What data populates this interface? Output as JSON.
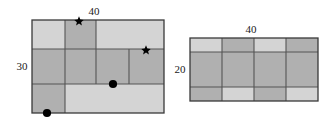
{
  "figure": {
    "title": "",
    "background_color": "#ffffff",
    "stroke_color": "#404040",
    "light_fill": "#d4d4d4",
    "dark_fill": "#b0b0b0",
    "marker_color": "#000000"
  },
  "labels": {
    "left_width": "40",
    "left_height": "30",
    "right_width": "40",
    "right_height": "20"
  },
  "left_rectangle": {
    "name": "left-rectangle",
    "width_label": "40",
    "height_label": "30",
    "cells": [
      {
        "id": "L-r1c1",
        "shade": "light"
      },
      {
        "id": "L-r1c2",
        "shade": "dark"
      },
      {
        "id": "L-r1c3",
        "shade": "light"
      },
      {
        "id": "L-r2c1",
        "shade": "dark"
      },
      {
        "id": "L-r2c2",
        "shade": "dark"
      },
      {
        "id": "L-r2c3",
        "shade": "dark"
      },
      {
        "id": "L-r2c4",
        "shade": "dark"
      },
      {
        "id": "L-r3c1",
        "shade": "dark"
      },
      {
        "id": "L-r3c2",
        "shade": "light"
      }
    ],
    "markers": [
      {
        "id": "L-star-top",
        "type": "star",
        "edge": "top"
      },
      {
        "id": "L-star-right",
        "type": "star",
        "edge": "right"
      },
      {
        "id": "L-dot-mid",
        "type": "dot",
        "edge": "interior"
      },
      {
        "id": "L-dot-bottom",
        "type": "dot",
        "edge": "bottom"
      }
    ]
  },
  "right_rectangle": {
    "name": "right-rectangle",
    "width_label": "40",
    "height_label": "20",
    "columns": 4,
    "rows": 3,
    "cells": [
      {
        "id": "R-r1c1",
        "shade": "light"
      },
      {
        "id": "R-r1c2",
        "shade": "dark"
      },
      {
        "id": "R-r1c3",
        "shade": "light"
      },
      {
        "id": "R-r1c4",
        "shade": "dark"
      },
      {
        "id": "R-r2c1",
        "shade": "dark"
      },
      {
        "id": "R-r2c2",
        "shade": "dark"
      },
      {
        "id": "R-r2c3",
        "shade": "dark"
      },
      {
        "id": "R-r2c4",
        "shade": "dark"
      },
      {
        "id": "R-r3c1",
        "shade": "dark"
      },
      {
        "id": "R-r3c2",
        "shade": "light"
      },
      {
        "id": "R-r3c3",
        "shade": "dark"
      },
      {
        "id": "R-r3c4",
        "shade": "light"
      }
    ]
  }
}
